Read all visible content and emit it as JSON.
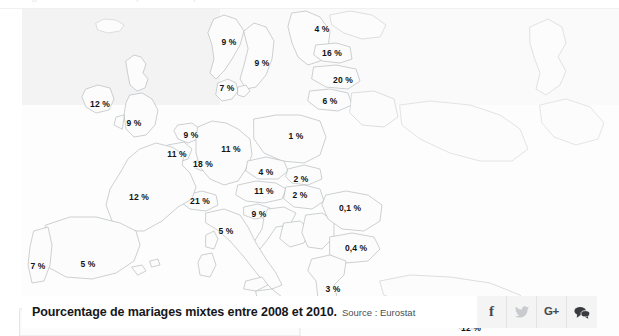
{
  "page": {
    "top_fragment": "mariages mixtes en europe  statistiques eurostat"
  },
  "map": {
    "alt": "Carte d'Europe - pourcentage de mariages mixtes",
    "colors": {
      "land_fill": "#fbfbfb",
      "border_stroke": "#b9bcc0",
      "sea_tint": "#f3f3f4",
      "label_color": "#111214"
    }
  },
  "caption": {
    "title": "Pourcentage de mariages mixtes entre 2008 et 2010.",
    "source": "Source : Eurostat"
  },
  "share": {
    "buttons": [
      {
        "name": "facebook",
        "label": "f"
      },
      {
        "name": "twitter",
        "label": ""
      },
      {
        "name": "google-plus",
        "label": "G+"
      },
      {
        "name": "comments",
        "label": ""
      }
    ]
  },
  "chart_data": {
    "type": "map",
    "title": "Pourcentage de mariages mixtes entre 2008 et 2010.",
    "source": "Source : Eurostat",
    "unit": "%",
    "value_format": "fr-FR (virgule decimale)",
    "regions": [
      {
        "country": "Finlande",
        "label": "4 %",
        "value": 4,
        "x": 322,
        "y": 20
      },
      {
        "country": "Norvege",
        "label": "9 %",
        "value": 9,
        "x": 229,
        "y": 33
      },
      {
        "country": "Estonie",
        "label": "16 %",
        "value": 16,
        "x": 332,
        "y": 44
      },
      {
        "country": "Suede",
        "label": "9 %",
        "value": 9,
        "x": 262,
        "y": 54
      },
      {
        "country": "Lettonie",
        "label": "20 %",
        "value": 20,
        "x": 343,
        "y": 71
      },
      {
        "country": "Danemark",
        "label": "7 %",
        "value": 7,
        "x": 227,
        "y": 79
      },
      {
        "country": "Lituanie",
        "label": "6 %",
        "value": 6,
        "x": 330,
        "y": 92
      },
      {
        "country": "Irlande",
        "label": "12 %",
        "value": 12,
        "x": 100,
        "y": 95
      },
      {
        "country": "Royaume-Uni",
        "label": "9 %",
        "value": 9,
        "x": 134,
        "y": 114
      },
      {
        "country": "Pologne",
        "label": "1 %",
        "value": 1,
        "x": 296,
        "y": 127
      },
      {
        "country": "Pays-Bas",
        "label": "9 %",
        "value": 9,
        "x": 191,
        "y": 126
      },
      {
        "country": "Allemagne",
        "label": "11 %",
        "value": 11,
        "x": 231,
        "y": 140
      },
      {
        "country": "Belgique",
        "label": "11 %",
        "value": 11,
        "x": 177,
        "y": 145
      },
      {
        "country": "Luxembourg",
        "label": "18 %",
        "value": 18,
        "x": 203,
        "y": 155
      },
      {
        "country": "Republique tcheque",
        "label": "4 %",
        "value": 4,
        "x": 266,
        "y": 163
      },
      {
        "country": "Slovaquie",
        "label": "2 %",
        "value": 2,
        "x": 301,
        "y": 170
      },
      {
        "country": "Autriche",
        "label": "11 %",
        "value": 11,
        "x": 264,
        "y": 182
      },
      {
        "country": "Hongrie",
        "label": "2 %",
        "value": 2,
        "x": 300,
        "y": 186
      },
      {
        "country": "France",
        "label": "12 %",
        "value": 12,
        "x": 139,
        "y": 188
      },
      {
        "country": "Suisse",
        "label": "21 %",
        "value": 21,
        "x": 200,
        "y": 192
      },
      {
        "country": "Roumanie",
        "label": "0,1 %",
        "value": 0.1,
        "x": 350,
        "y": 199
      },
      {
        "country": "Slovenie",
        "label": "9 %",
        "value": 9,
        "x": 259,
        "y": 205
      },
      {
        "country": "Italie",
        "label": "5 %",
        "value": 5,
        "x": 226,
        "y": 222
      },
      {
        "country": "Bulgarie",
        "label": "0,4 %",
        "value": 0.4,
        "x": 356,
        "y": 239
      },
      {
        "country": "Portugal",
        "label": "7 %",
        "value": 7,
        "x": 38,
        "y": 257
      },
      {
        "country": "Espagne",
        "label": "5 %",
        "value": 5,
        "x": 88,
        "y": 255
      },
      {
        "country": "Grece",
        "label": "3 %",
        "value": 3,
        "x": 333,
        "y": 280
      },
      {
        "country": "Chypre",
        "label": "12 %",
        "value": 12,
        "x": 471,
        "y": 319
      }
    ]
  }
}
